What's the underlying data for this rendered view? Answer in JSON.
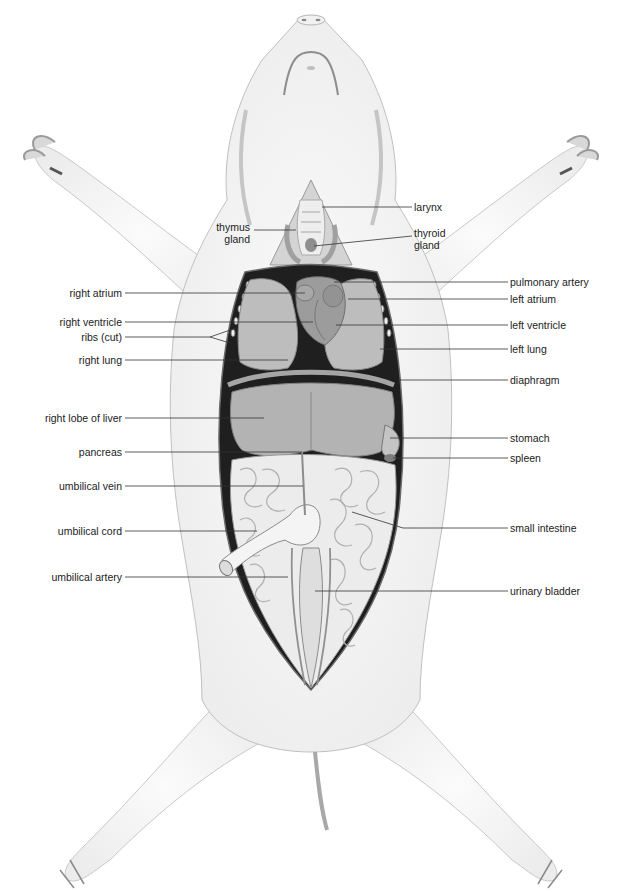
{
  "diagram": {
    "colors": {
      "background": "#ffffff",
      "skin": "#f7f7f7",
      "skin_outline": "#bdbdbd",
      "cavity": "#1f1f1f",
      "organ": "#b9b9b9",
      "organ_dark": "#8e8e8e",
      "intestine": "#ececec",
      "leader_line": "#333333",
      "label_text": "#222222"
    },
    "labels_left": [
      {
        "text": "thymus\ngland",
        "x": 248,
        "y": 228
      },
      {
        "text": "right atrium",
        "x": 122,
        "y": 293
      },
      {
        "text": "right ventricle",
        "x": 122,
        "y": 322
      },
      {
        "text": "ribs (cut)",
        "x": 122,
        "y": 337
      },
      {
        "text": "right lung",
        "x": 122,
        "y": 360
      },
      {
        "text": "right lobe of liver",
        "x": 122,
        "y": 418
      },
      {
        "text": "pancreas",
        "x": 122,
        "y": 452
      },
      {
        "text": "umbilical vein",
        "x": 122,
        "y": 486
      },
      {
        "text": "umbilical cord",
        "x": 122,
        "y": 531
      },
      {
        "text": "umbilical artery",
        "x": 122,
        "y": 577
      }
    ],
    "labels_right": [
      {
        "text": "larynx",
        "x": 414,
        "y": 207
      },
      {
        "text": "thyroid\ngland",
        "x": 414,
        "y": 238
      },
      {
        "text": "pulmonary artery",
        "x": 510,
        "y": 282
      },
      {
        "text": "left atrium",
        "x": 510,
        "y": 299
      },
      {
        "text": "left ventricle",
        "x": 510,
        "y": 325
      },
      {
        "text": "left lung",
        "x": 510,
        "y": 349
      },
      {
        "text": "diaphragm",
        "x": 510,
        "y": 380
      },
      {
        "text": "stomach",
        "x": 510,
        "y": 438
      },
      {
        "text": "spleen",
        "x": 510,
        "y": 458
      },
      {
        "text": "small intestine",
        "x": 510,
        "y": 528
      },
      {
        "text": "urinary bladder",
        "x": 510,
        "y": 591
      }
    ]
  }
}
